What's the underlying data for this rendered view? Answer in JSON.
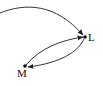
{
  "diagram": {
    "type": "directed-graph",
    "nodes": [
      {
        "id": "L",
        "label": "L",
        "x": 85,
        "y": 37
      },
      {
        "id": "M",
        "label": "M",
        "x": 25,
        "y": 66
      }
    ],
    "edges": [
      {
        "from": "offscreen-left",
        "to": "L",
        "style": "curved"
      },
      {
        "from": "M",
        "to": "L",
        "style": "curved-upper"
      },
      {
        "from": "L",
        "to": "M",
        "style": "curved-lower"
      }
    ],
    "colors": {
      "stroke": "#222222",
      "background": "#ffffff"
    }
  }
}
